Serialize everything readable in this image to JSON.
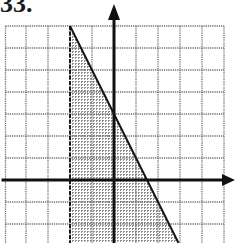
{
  "problem": {
    "number_label": "33."
  },
  "graph": {
    "origin_px": {
      "x": 114,
      "y": 180
    },
    "unit_px": 22,
    "grid": {
      "x_min": -5,
      "x_max": 5,
      "y_max": 7,
      "y_min": -3,
      "line_color": "#6b6b6b",
      "line_style": "dotted"
    },
    "axes": {
      "color": "#111111",
      "x_axis_arrow": "right",
      "y_axis_arrow": "up"
    },
    "boundaries": [
      {
        "name": "vertical-dashed-boundary",
        "equation": "x = -2",
        "style": "dashed"
      },
      {
        "name": "diagonal-solid-boundary",
        "equation": "y = -2x + 3",
        "style": "solid"
      }
    ],
    "shaded_region": {
      "description": "x > -2 and y <= -2x + 3",
      "pattern_color": "#8a8a8a"
    }
  }
}
